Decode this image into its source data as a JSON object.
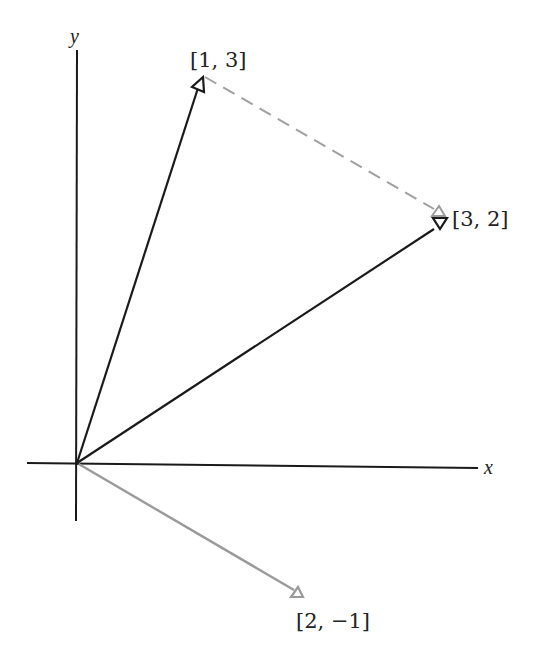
{
  "diagram": {
    "axes": {
      "x_label": "x",
      "y_label": "y"
    },
    "vectors": [
      {
        "name": "a",
        "components": [
          1,
          3
        ],
        "label": "[1, 3]",
        "color": "#1a1a1a",
        "style": "solid"
      },
      {
        "name": "b",
        "components": [
          3,
          2
        ],
        "label": "[3, 2]",
        "color": "#1a1a1a",
        "style": "solid"
      },
      {
        "name": "difference",
        "components": [
          2,
          -1
        ],
        "label": "[2, −1]",
        "color": "#9a9a9a",
        "style": "solid"
      }
    ],
    "connector": {
      "from": "[1, 3]",
      "to": "[3, 2]",
      "color": "#a0a0a0",
      "style": "dashed",
      "represents": "[2, −1] translated to tip of [1, 3]"
    },
    "colors": {
      "foreground": "#1a1a1a",
      "gray": "#9a9a9a",
      "background": "#ffffff"
    }
  }
}
